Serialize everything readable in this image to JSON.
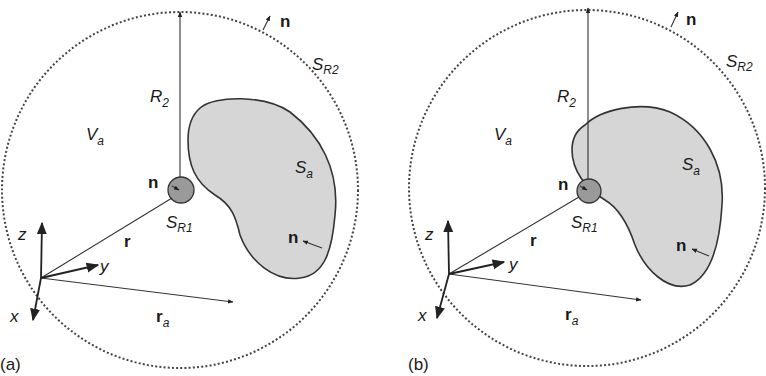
{
  "figure": {
    "panels": [
      {
        "id": "a",
        "panel_label": "(a)",
        "outer_sphere_label": "S",
        "outer_sphere_sub": "R2",
        "radius_label": "R",
        "radius_sub": "2",
        "volume_label": "V",
        "volume_sub": "a",
        "body_surface_label": "S",
        "body_surface_sub": "a",
        "inner_sphere_label": "S",
        "inner_sphere_sub": "R1",
        "normal_label": "n",
        "position_label": "r",
        "source_position_label": "r",
        "source_position_sub": "a",
        "axis_x": "x",
        "axis_y": "y",
        "axis_z": "z",
        "description": "Inner sphere S_R1 separate from body S_a"
      },
      {
        "id": "b",
        "panel_label": "(b)",
        "outer_sphere_label": "S",
        "outer_sphere_sub": "R2",
        "radius_label": "R",
        "radius_sub": "2",
        "volume_label": "V",
        "volume_sub": "a",
        "body_surface_label": "S",
        "body_surface_sub": "a",
        "inner_sphere_label": "S",
        "inner_sphere_sub": "R1",
        "normal_label": "n",
        "position_label": "r",
        "source_position_label": "r",
        "source_position_sub": "a",
        "axis_x": "x",
        "axis_y": "y",
        "axis_z": "z",
        "description": "Inner sphere S_R1 overlapping body S_a"
      }
    ],
    "colors": {
      "body_fill": "#d6d6d6",
      "inner_sphere_fill": "#9a9a9a",
      "stroke": "#333333"
    }
  }
}
